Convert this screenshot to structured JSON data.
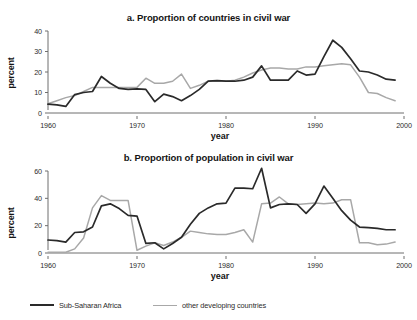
{
  "figure": {
    "series_names": [
      "Sub-Saharan Africa",
      "other developing countries"
    ],
    "colors": {
      "sub_saharan_africa": "#2a2a2a",
      "other_developing_countries": "#a8a8a8",
      "axis": "#6e6e6e",
      "text": "#1a1a1a"
    }
  },
  "legend": {
    "position": "bottom-left",
    "items": [
      {
        "label": "Sub-Saharan Africa",
        "color": "#2a2a2a"
      },
      {
        "label": "other developing countries",
        "color": "#a8a8a8"
      }
    ]
  },
  "chart_data": [
    {
      "type": "line",
      "id": "panel-a",
      "title": "a. Proportion of countries in civil war",
      "xlabel": "year",
      "ylabel": "percent",
      "xlim": [
        1960,
        2000
      ],
      "ylim": [
        0,
        40
      ],
      "xticks": [
        1960,
        1970,
        1980,
        1990,
        2000
      ],
      "xtick_labels": [
        "1960",
        "1970",
        "1980",
        "1990",
        "2000"
      ],
      "yticks": [
        0,
        10,
        20,
        30,
        40
      ],
      "ytick_labels": [
        "0",
        "10",
        "20",
        "30",
        "40"
      ],
      "grid": false,
      "legend_position": "figure-bottom",
      "x": [
        1960,
        1961,
        1962,
        1963,
        1964,
        1965,
        1966,
        1967,
        1968,
        1969,
        1970,
        1971,
        1972,
        1973,
        1974,
        1975,
        1976,
        1977,
        1978,
        1979,
        1980,
        1981,
        1982,
        1983,
        1984,
        1985,
        1986,
        1987,
        1988,
        1989,
        1990,
        1991,
        1992,
        1993,
        1994,
        1995,
        1996,
        1997,
        1998,
        1999
      ],
      "series": [
        {
          "name": "Sub-Saharan Africa",
          "color": "#2a2a2a",
          "values": [
            4.3,
            4.0,
            3.2,
            9.0,
            10.0,
            10.5,
            17.8,
            14.5,
            12.0,
            11.5,
            11.8,
            11.5,
            5.5,
            9.2,
            8.0,
            6.0,
            8.5,
            11.5,
            15.5,
            15.8,
            15.5,
            15.5,
            16.0,
            17.5,
            23.0,
            16.0,
            16.0,
            16.0,
            20.5,
            18.5,
            19.0,
            27.5,
            35.5,
            32.0,
            26.5,
            20.5,
            20.0,
            18.5,
            16.5,
            16.0
          ]
        },
        {
          "name": "other developing countries",
          "color": "#a8a8a8",
          "values": [
            4.5,
            6.0,
            7.5,
            8.5,
            10.5,
            12.5,
            12.5,
            12.5,
            12.5,
            12.5,
            12.5,
            17.0,
            14.5,
            14.5,
            15.5,
            19.0,
            12.0,
            13.5,
            15.5,
            15.5,
            15.5,
            16.0,
            17.5,
            19.5,
            21.0,
            22.0,
            22.0,
            21.5,
            21.5,
            22.5,
            22.5,
            23.0,
            23.5,
            24.0,
            23.5,
            17.5,
            10.0,
            9.5,
            7.5,
            6.0
          ]
        }
      ]
    },
    {
      "type": "line",
      "id": "panel-b",
      "title": "b. Proportion of population in civil war",
      "xlabel": "year",
      "ylabel": "percent",
      "xlim": [
        1960,
        2000
      ],
      "ylim": [
        0,
        60
      ],
      "xticks": [
        1960,
        1970,
        1980,
        1990,
        2000
      ],
      "xtick_labels": [
        "1960",
        "1970",
        "1980",
        "1990",
        "2000"
      ],
      "yticks": [
        0,
        20,
        40,
        60
      ],
      "ytick_labels": [
        "0",
        "20",
        "40",
        "60"
      ],
      "grid": false,
      "legend_position": "figure-bottom",
      "x": [
        1960,
        1961,
        1962,
        1963,
        1964,
        1965,
        1966,
        1967,
        1968,
        1969,
        1970,
        1971,
        1972,
        1973,
        1974,
        1975,
        1976,
        1977,
        1978,
        1979,
        1980,
        1981,
        1982,
        1983,
        1984,
        1985,
        1986,
        1987,
        1988,
        1989,
        1990,
        1991,
        1992,
        1993,
        1994,
        1995,
        1996,
        1997,
        1998,
        1999
      ],
      "series": [
        {
          "name": "Sub-Saharan Africa",
          "color": "#2a2a2a",
          "values": [
            9.5,
            9.0,
            8.0,
            15.0,
            15.5,
            19.0,
            34.5,
            36.0,
            32.5,
            27.5,
            27.0,
            7.0,
            7.5,
            3.0,
            7.0,
            11.5,
            21.0,
            29.0,
            33.0,
            36.0,
            36.5,
            47.5,
            47.5,
            47.0,
            62.0,
            33.0,
            35.5,
            36.0,
            35.5,
            29.0,
            36.0,
            49.0,
            40.0,
            31.0,
            24.0,
            19.0,
            18.5,
            18.0,
            17.0,
            17.0
          ]
        },
        {
          "name": "other developing countries",
          "color": "#a8a8a8",
          "values": [
            0.5,
            0.5,
            0.5,
            3.0,
            11.0,
            33.0,
            42.0,
            38.5,
            38.5,
            38.5,
            2.0,
            5.0,
            7.5,
            5.5,
            8.0,
            11.5,
            16.0,
            15.0,
            14.0,
            13.5,
            13.5,
            15.0,
            17.0,
            8.0,
            36.0,
            36.5,
            41.0,
            36.0,
            35.5,
            36.0,
            36.5,
            36.0,
            36.5,
            39.0,
            39.0,
            7.5,
            7.5,
            6.0,
            6.5,
            8.0
          ]
        }
      ]
    }
  ]
}
